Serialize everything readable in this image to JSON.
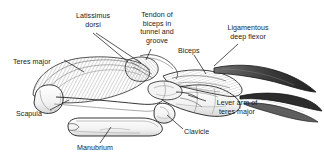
{
  "figure": {
    "background_color": "#ffffff",
    "ink_color": "#1b1b1b",
    "shade_color": "#9a9a9a",
    "width": 324,
    "height": 168
  },
  "labels": [
    {
      "id": "latissimus-dorsi",
      "text": "Latissimus\ndorsi",
      "align": "center",
      "x": 67,
      "y": 12,
      "width": 52
    },
    {
      "id": "tendon-of-biceps",
      "text": "Tendon of\nbiceps in\ntunnel and\ngroove",
      "align": "center",
      "x": 129,
      "y": 11,
      "width": 56
    },
    {
      "id": "ligamentous-deep-flexor",
      "text": "Ligamentous\ndeep flexor",
      "align": "center",
      "x": 213,
      "y": 24,
      "width": 70
    },
    {
      "id": "teres-major",
      "text": "Teres major",
      "align": "left",
      "x": 13,
      "y": 58,
      "width": 50
    },
    {
      "id": "biceps",
      "text": "Biceps",
      "align": "left",
      "x": 178,
      "y": 47,
      "width": 28
    },
    {
      "id": "scapula",
      "text": "Scapula",
      "align": "left",
      "x": 16,
      "y": 110,
      "width": 34
    },
    {
      "id": "lever-arm-of-teres-major",
      "text": "Lever arm of\nteres major",
      "align": "center",
      "x": 208,
      "y": 99,
      "width": 58
    },
    {
      "id": "manubrium",
      "text": "Manubrium",
      "align": "left",
      "x": 77,
      "y": 144,
      "width": 48
    },
    {
      "id": "clavicle",
      "text": "Clavicle",
      "align": "left",
      "x": 184,
      "y": 128,
      "width": 34
    }
  ],
  "leaders": [
    {
      "id": "leader-latissimus-a",
      "points": "93,33 128,62"
    },
    {
      "id": "leader-latissimus-b",
      "points": "96,33 141,63"
    },
    {
      "id": "leader-tendon",
      "points": "151,49 146,60"
    },
    {
      "id": "leader-ligamentous",
      "points": "238,44 214,66"
    },
    {
      "id": "leader-teres-major",
      "points": "64,60 84,72"
    },
    {
      "id": "leader-biceps",
      "points": "194,55 206,74"
    },
    {
      "id": "leader-scapula",
      "points": "50,110 69,100"
    },
    {
      "id": "leader-lever-arm",
      "points": "206,101 188,95"
    },
    {
      "id": "leader-manubrium",
      "points": "100,143 111,127"
    },
    {
      "id": "leader-clavicle",
      "points": "183,129 167,115"
    }
  ],
  "structures": [
    {
      "id": "teres-major-muscle",
      "kind": "muscle",
      "note": "large hatched muscle mass, upper left body"
    },
    {
      "id": "latissimus-dorsi-muscle",
      "kind": "muscle",
      "note": "hatched muscle converging to insertion"
    },
    {
      "id": "scapula-bone",
      "kind": "bone",
      "note": "broad flat blade, lower left"
    },
    {
      "id": "manubrium-bone",
      "kind": "bone",
      "note": "elongated ventral bone, lower center"
    },
    {
      "id": "clavicle-bone",
      "kind": "bone",
      "note": "short strut at shoulder joint"
    },
    {
      "id": "humerus-bone",
      "kind": "bone",
      "note": "limb shaft running right"
    },
    {
      "id": "biceps-muscle",
      "kind": "muscle",
      "note": "shaded belly along limb"
    },
    {
      "id": "ligamentous-deep-flexor-tendon",
      "kind": "tendon",
      "note": "dark tapering band to claw"
    },
    {
      "id": "claw",
      "kind": "bone",
      "note": "curved terminal claw, far right"
    }
  ]
}
